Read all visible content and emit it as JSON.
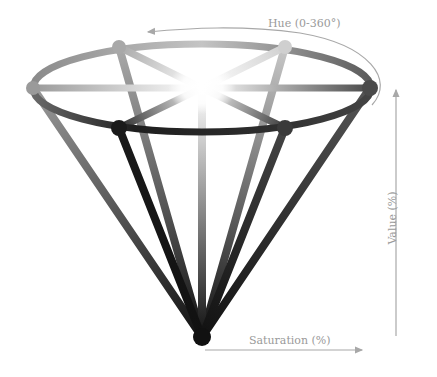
{
  "labels": {
    "hue": "Hue (0-360°)",
    "value": "Value (%)",
    "saturation": "Saturation (%)"
  },
  "colors": {
    "background": "#ffffff",
    "axis": "#a8a8a8",
    "label": "#9a9a9a",
    "vertex": "#111111",
    "rim_light": "#c8c8c8",
    "rim_dark": "#2a2a2a",
    "center_glow": "#ffffff"
  },
  "geometry": {
    "vertex": [
      202,
      337
    ],
    "top_center": [
      202,
      88
    ],
    "rim_rx": 170,
    "rim_ry": 46
  },
  "nodes": [
    {
      "name": "left",
      "pos": [
        33,
        88
      ],
      "shade": "#9a9a9a"
    },
    {
      "name": "back-left",
      "pos": [
        119,
        47
      ],
      "shade": "#a8a8a8"
    },
    {
      "name": "back-right",
      "pos": [
        285,
        47
      ],
      "shade": "#c8c8c8"
    },
    {
      "name": "right",
      "pos": [
        370,
        88
      ],
      "shade": "#4a4a4a"
    },
    {
      "name": "front-right",
      "pos": [
        285,
        128
      ],
      "shade": "#3a3a3a"
    },
    {
      "name": "front-left",
      "pos": [
        119,
        128
      ],
      "shade": "#1a1a1a"
    }
  ]
}
